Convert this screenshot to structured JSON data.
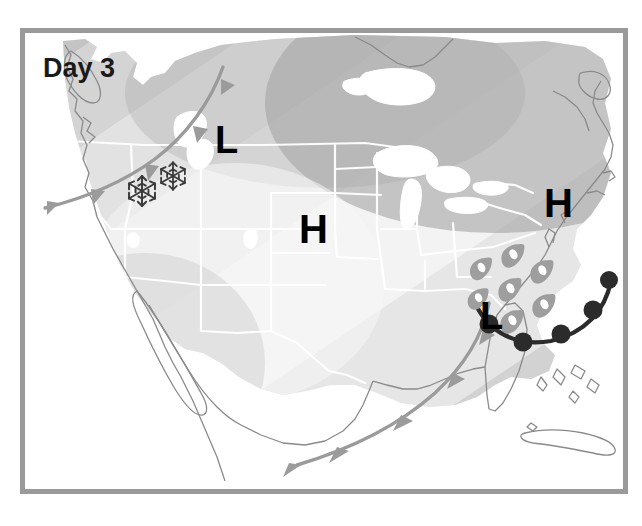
{
  "panel": {
    "frame_color": "#9a9a9a",
    "background_color": "#ffffff"
  },
  "title": {
    "text": "Day 3",
    "color": "#1a1a1a"
  },
  "legend_colors": {
    "land_base": "#f2f2f2",
    "band_1": "#ececec",
    "band_2": "#e0e0e0",
    "band_3": "#d4d4d4",
    "band_4": "#c6c6c6",
    "band_5": "#b4b4b4",
    "band_6": "#a6a6a6",
    "water": "#ffffff",
    "state_border": "#ffffff",
    "coastline": "#8a8a8a",
    "cold_front": "#9b9b9b",
    "warm_front": "#2b2b2b",
    "precip_snow": "#3a3a3a",
    "precip_rain": "#9e9e9e",
    "precip_rain_highlight": "#ffffff"
  },
  "pressure_centers": [
    {
      "id": "low-northwest",
      "type": "L",
      "label": "L",
      "x": 212,
      "y": 116,
      "size": 34
    },
    {
      "id": "high-central",
      "type": "H",
      "label": "H",
      "x": 296,
      "y": 205,
      "size": 36
    },
    {
      "id": "high-northeast",
      "type": "H",
      "label": "H",
      "x": 541,
      "y": 179,
      "size": 36
    },
    {
      "id": "low-southeast",
      "type": "L",
      "label": "L",
      "x": 477,
      "y": 292,
      "size": 34
    }
  ],
  "fronts": [
    {
      "id": "cold-front-northwest",
      "kind": "cold",
      "symbol": "triangles",
      "color": "#9b9b9b",
      "path": "M 218 62 C 205 96, 180 128, 148 152 C 118 174, 82 190, 38 201",
      "barb_count": 4
    },
    {
      "id": "cold-front-southeast",
      "kind": "cold",
      "symbol": "triangles",
      "color": "#9b9b9b",
      "path": "M 486 300 C 474 330, 452 362, 418 392 C 378 426, 332 454, 288 470",
      "barb_count": 4
    },
    {
      "id": "warm-front-atlantic",
      "kind": "warm",
      "symbol": "semicircles",
      "color": "#2b2b2b",
      "path": "M 472 292 C 486 320, 512 332, 545 326 C 578 318, 597 297, 602 272",
      "bump_count": 4
    }
  ],
  "precipitation": [
    {
      "id": "snow-1",
      "type": "snowflake",
      "x": 131,
      "y": 172,
      "size": 30
    },
    {
      "id": "snow-2",
      "type": "snowflake",
      "x": 163,
      "y": 158,
      "size": 28
    },
    {
      "id": "rain-1",
      "type": "raindrop",
      "x": 505,
      "y": 252,
      "size": 26
    },
    {
      "id": "rain-2",
      "type": "raindrop",
      "x": 534,
      "y": 267,
      "size": 26
    },
    {
      "id": "rain-3",
      "type": "raindrop",
      "x": 507,
      "y": 284,
      "size": 26
    },
    {
      "id": "rain-4",
      "type": "raindrop",
      "x": 536,
      "y": 299,
      "size": 26
    },
    {
      "id": "rain-5",
      "type": "raindrop",
      "x": 508,
      "y": 315,
      "size": 26
    },
    {
      "id": "rain-6",
      "type": "raindrop",
      "x": 477,
      "y": 259,
      "size": 24
    }
  ],
  "temperature_bands": [
    {
      "id": "band-warmest",
      "shade": "#f4f4f4"
    },
    {
      "id": "band-warm",
      "shade": "#ececec"
    },
    {
      "id": "band-mild",
      "shade": "#e2e2e2"
    },
    {
      "id": "band-cool",
      "shade": "#d6d6d6"
    },
    {
      "id": "band-cold",
      "shade": "#c6c6c6"
    },
    {
      "id": "band-colder",
      "shade": "#b6b6b6"
    },
    {
      "id": "band-coldest",
      "shade": "#a8a8a8"
    }
  ],
  "icon_names": {
    "snowflake": "snowflake-icon",
    "raindrop": "raindrop-icon",
    "cold_front": "cold-front-icon",
    "warm_front": "warm-front-icon",
    "high_pressure": "high-pressure-icon",
    "low_pressure": "low-pressure-icon"
  }
}
